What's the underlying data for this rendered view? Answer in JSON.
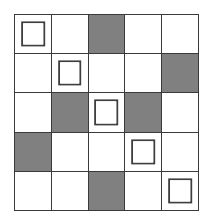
{
  "figure": {
    "name": "shaded-grid-pattern",
    "type": "grid-diagram",
    "rows": 5,
    "columns": 5,
    "colors": {
      "background": "#ffffff",
      "cell_white": "#ffffff",
      "cell_shaded": "#808080",
      "grid_line": "#3a3a3a",
      "marker_outline": "#3f3f3f"
    },
    "legend": {
      "shaded_label": "shaded",
      "white_label": "white",
      "marked_label": "marked"
    }
  },
  "grid": {
    "cells": [
      [
        {
          "row": 1,
          "col": 1,
          "fill": "white",
          "marked": true
        },
        {
          "row": 1,
          "col": 2,
          "fill": "white",
          "marked": false
        },
        {
          "row": 1,
          "col": 3,
          "fill": "shaded",
          "marked": false
        },
        {
          "row": 1,
          "col": 4,
          "fill": "white",
          "marked": false
        },
        {
          "row": 1,
          "col": 5,
          "fill": "white",
          "marked": false
        }
      ],
      [
        {
          "row": 2,
          "col": 1,
          "fill": "white",
          "marked": false
        },
        {
          "row": 2,
          "col": 2,
          "fill": "white",
          "marked": true
        },
        {
          "row": 2,
          "col": 3,
          "fill": "white",
          "marked": false
        },
        {
          "row": 2,
          "col": 4,
          "fill": "white",
          "marked": false
        },
        {
          "row": 2,
          "col": 5,
          "fill": "shaded",
          "marked": false
        }
      ],
      [
        {
          "row": 3,
          "col": 1,
          "fill": "white",
          "marked": false
        },
        {
          "row": 3,
          "col": 2,
          "fill": "shaded",
          "marked": false
        },
        {
          "row": 3,
          "col": 3,
          "fill": "white",
          "marked": true
        },
        {
          "row": 3,
          "col": 4,
          "fill": "shaded",
          "marked": false
        },
        {
          "row": 3,
          "col": 5,
          "fill": "white",
          "marked": false
        }
      ],
      [
        {
          "row": 4,
          "col": 1,
          "fill": "shaded",
          "marked": false
        },
        {
          "row": 4,
          "col": 2,
          "fill": "white",
          "marked": false
        },
        {
          "row": 4,
          "col": 3,
          "fill": "white",
          "marked": false
        },
        {
          "row": 4,
          "col": 4,
          "fill": "white",
          "marked": true
        },
        {
          "row": 4,
          "col": 5,
          "fill": "white",
          "marked": false
        }
      ],
      [
        {
          "row": 5,
          "col": 1,
          "fill": "white",
          "marked": false
        },
        {
          "row": 5,
          "col": 2,
          "fill": "white",
          "marked": false
        },
        {
          "row": 5,
          "col": 3,
          "fill": "shaded",
          "marked": false
        },
        {
          "row": 5,
          "col": 4,
          "fill": "white",
          "marked": false
        },
        {
          "row": 5,
          "col": 5,
          "fill": "white",
          "marked": true
        }
      ]
    ]
  }
}
